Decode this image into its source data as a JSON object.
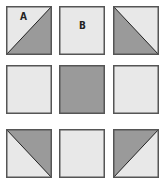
{
  "colors": {
    "light": "#e8e8e8",
    "dark": "#9a9a9a",
    "border": "#555555",
    "diagonal": "#222222"
  },
  "blocks": [
    {
      "row": 0,
      "col": 0,
      "type": "half-square",
      "dark_corner": "bottom-right",
      "label": "A"
    },
    {
      "row": 0,
      "col": 1,
      "type": "solid",
      "fill": "light",
      "label": "B"
    },
    {
      "row": 0,
      "col": 2,
      "type": "half-square",
      "dark_corner": "bottom-left",
      "label": ""
    },
    {
      "row": 1,
      "col": 0,
      "type": "solid",
      "fill": "light",
      "label": ""
    },
    {
      "row": 1,
      "col": 1,
      "type": "solid",
      "fill": "dark",
      "label": ""
    },
    {
      "row": 1,
      "col": 2,
      "type": "solid",
      "fill": "light",
      "label": ""
    },
    {
      "row": 2,
      "col": 0,
      "type": "half-square",
      "dark_corner": "top-right",
      "label": ""
    },
    {
      "row": 2,
      "col": 1,
      "type": "solid",
      "fill": "light",
      "label": ""
    },
    {
      "row": 2,
      "col": 2,
      "type": "half-square",
      "dark_corner": "top-left",
      "label": ""
    }
  ]
}
